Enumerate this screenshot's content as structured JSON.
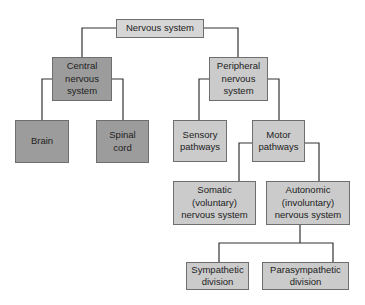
{
  "diagram": {
    "type": "hierarchy",
    "nodes": {
      "root": "Nervous system",
      "cns": "Central\nnervous\nsystem",
      "pns": "Peripheral\nnervous\nsystem",
      "brain": "Brain",
      "spinal": "Spinal\ncord",
      "sensory": "Sensory\npathways",
      "motor": "Motor\npathways",
      "somatic": "Somatic\n(voluntary)\nnervous system",
      "autonomic": "Autonomic\n(involuntary)\nnervous system",
      "sympathetic": "Sympathetic\ndivision",
      "parasympathetic": "Parasympathetic\ndivision"
    },
    "edges": [
      [
        "Nervous system",
        "Central nervous system"
      ],
      [
        "Nervous system",
        "Peripheral nervous system"
      ],
      [
        "Central nervous system",
        "Brain"
      ],
      [
        "Central nervous system",
        "Spinal cord"
      ],
      [
        "Peripheral nervous system",
        "Sensory pathways"
      ],
      [
        "Peripheral nervous system",
        "Motor pathways"
      ],
      [
        "Motor pathways",
        "Somatic (voluntary) nervous system"
      ],
      [
        "Motor pathways",
        "Autonomic (involuntary) nervous system"
      ],
      [
        "Autonomic (involuntary) nervous system",
        "Sympathetic division"
      ],
      [
        "Autonomic (involuntary) nervous system",
        "Parasympathetic division"
      ]
    ],
    "colors": {
      "cns_branch": "#9c9c9c",
      "pns_branch": "#cbcbcb",
      "root": "#d6d6d6",
      "line": "#333333"
    }
  }
}
